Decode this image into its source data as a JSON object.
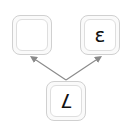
{
  "diagram": {
    "nodes": {
      "left": {
        "label": ""
      },
      "right": {
        "label": "ε"
      },
      "bottom": {
        "label": "7",
        "rotated": "180deg"
      }
    },
    "edges": [
      {
        "from": "bottom",
        "to": "left"
      },
      {
        "from": "bottom",
        "to": "right"
      }
    ],
    "colors": {
      "arrow": "#8a8a8a",
      "key_border": "#d0d0d0",
      "glyph": "#111111"
    }
  }
}
